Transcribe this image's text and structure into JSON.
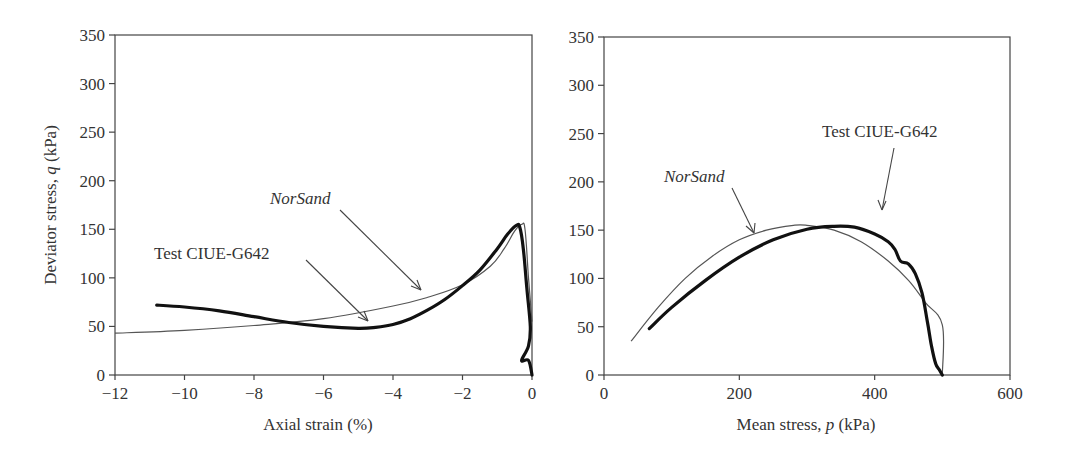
{
  "chart_data": [
    {
      "type": "line",
      "title": "",
      "xlabel": "Axial strain (%)",
      "ylabel": "Deviator stress, q (kPa)",
      "xlim": [
        -12,
        0
      ],
      "ylim": [
        0,
        350
      ],
      "xticks": [
        "−12",
        "−10",
        "−8",
        "−6",
        "−4",
        "−2",
        "0"
      ],
      "yticks": [
        "0",
        "50",
        "100",
        "150",
        "200",
        "250",
        "300",
        "350"
      ],
      "grid": false,
      "annotations": [
        {
          "text": "NorSand",
          "italic": true,
          "points_to": "NorSand"
        },
        {
          "text": "Test CIUE-G642",
          "italic": false,
          "points_to": "Test CIUE-G642"
        }
      ],
      "series": [
        {
          "name": "NorSand",
          "style": "thin",
          "x": [
            -12,
            -10,
            -8,
            -6,
            -4,
            -3,
            -2,
            -1.2,
            -0.8,
            -0.5,
            -0.3,
            -0.2,
            -0.1,
            0
          ],
          "y": [
            43,
            46,
            51,
            58,
            71,
            80,
            93,
            112,
            130,
            148,
            155,
            150,
            100,
            55
          ]
        },
        {
          "name": "Test CIUE-G642",
          "style": "thick",
          "x": [
            -10.8,
            -10,
            -9,
            -8,
            -7,
            -6,
            -5,
            -4.5,
            -4,
            -3.5,
            -3,
            -2.5,
            -2,
            -1.5,
            -1,
            -0.7,
            -0.45,
            -0.35,
            -0.25,
            -0.15,
            -0.05,
            -0.1,
            -0.3,
            -0.1,
            0
          ],
          "y": [
            72,
            70,
            66,
            60,
            54,
            50,
            48,
            49,
            52,
            58,
            67,
            78,
            92,
            108,
            130,
            145,
            154,
            152,
            130,
            90,
            50,
            30,
            15,
            15,
            0
          ]
        }
      ]
    },
    {
      "type": "line",
      "title": "",
      "xlabel": "Mean stress, p (kPa)",
      "ylabel": "",
      "xlim": [
        0,
        600
      ],
      "ylim": [
        0,
        350
      ],
      "xticks": [
        "0",
        "200",
        "400",
        "600"
      ],
      "yticks": [
        "0",
        "50",
        "100",
        "150",
        "200",
        "250",
        "300",
        "350"
      ],
      "grid": false,
      "annotations": [
        {
          "text": "NorSand",
          "italic": true,
          "points_to": "NorSand"
        },
        {
          "text": "Test CIUE-G642",
          "italic": false,
          "points_to": "Test CIUE-G642"
        }
      ],
      "series": [
        {
          "name": "NorSand",
          "style": "thin",
          "x": [
            40,
            80,
            120,
            160,
            200,
            240,
            280,
            300,
            340,
            380,
            420,
            450,
            475,
            500,
            500
          ],
          "y": [
            35,
            70,
            100,
            123,
            140,
            150,
            155,
            155,
            150,
            138,
            118,
            98,
            75,
            52,
            0
          ]
        },
        {
          "name": "Test CIUE-G642",
          "style": "thick",
          "x": [
            67,
            100,
            150,
            200,
            250,
            300,
            340,
            370,
            400,
            420,
            430,
            438,
            450,
            460,
            470,
            478,
            484,
            490,
            496,
            500
          ],
          "y": [
            48,
            70,
            98,
            122,
            140,
            151,
            154,
            153,
            146,
            138,
            130,
            118,
            115,
            105,
            85,
            55,
            30,
            12,
            5,
            0
          ]
        }
      ]
    }
  ],
  "left": {
    "ylabel_main": "Deviator stress, ",
    "ylabel_var": "q",
    "ylabel_unit": " (kPa)",
    "xlabel": "Axial strain (%)",
    "annot_model": "NorSand",
    "annot_test": "Test CIUE-G642"
  },
  "right": {
    "xlabel_main": "Mean stress, ",
    "xlabel_var": "p",
    "xlabel_unit": " (kPa)",
    "annot_model": "NorSand",
    "annot_test": "Test CIUE-G642"
  }
}
